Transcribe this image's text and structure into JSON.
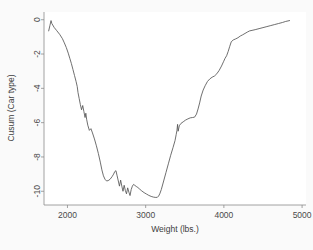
{
  "chart_data": {
    "type": "line",
    "title": "",
    "subtitle": "",
    "xlabel": "Weight (lbs.)",
    "ylabel": "Cusum (Car type)",
    "xlim": [
      1700,
      5050
    ],
    "ylim": [
      -10.8,
      0.45
    ],
    "xticks": [
      2000,
      3000,
      4000,
      5000
    ],
    "xticklabels": [
      "2000",
      "3000",
      "4000",
      "5000"
    ],
    "yticks": [
      0,
      -2,
      -4,
      -6,
      -8,
      -10
    ],
    "yticklabels": [
      "0",
      "-2",
      "-4",
      "-6",
      "-8",
      "-10"
    ],
    "grid": false,
    "legend": null,
    "annotations": [],
    "series": [
      {
        "name": "Cusum (Car type)",
        "color": "#555555",
        "x": [
          1760,
          1775,
          1790,
          1800,
          1830,
          1860,
          1900,
          1935,
          1960,
          1985,
          2010,
          2030,
          2050,
          2070,
          2090,
          2110,
          2125,
          2135,
          2150,
          2165,
          2180,
          2195,
          2210,
          2225,
          2235,
          2245,
          2260,
          2280,
          2300,
          2320,
          2345,
          2370,
          2395,
          2420,
          2440,
          2460,
          2480,
          2500,
          2520,
          2545,
          2570,
          2590,
          2605,
          2620,
          2635,
          2650,
          2665,
          2680,
          2695,
          2710,
          2725,
          2740,
          2755,
          2770,
          2785,
          2800,
          2815,
          2830,
          2845,
          2860,
          2880,
          2900,
          2925,
          2950,
          2980,
          3010,
          3040,
          3070,
          3100,
          3130,
          3150,
          3165,
          3180,
          3200,
          3230,
          3260,
          3290,
          3320,
          3350,
          3375,
          3390,
          3400,
          3408,
          3415,
          3430,
          3450,
          3480,
          3510,
          3540,
          3570,
          3600,
          3625,
          3650,
          3670,
          3690,
          3710,
          3735,
          3760,
          3790,
          3820,
          3850,
          3880,
          3910,
          3940,
          3970,
          3995,
          4015,
          4035,
          4055,
          4075,
          4095,
          4120,
          4150,
          4180,
          4210,
          4240,
          4270,
          4300,
          4330,
          4360,
          4400,
          4450,
          4500,
          4550,
          4600,
          4650,
          4700,
          4750,
          4790,
          4840
        ],
        "y": [
          -0.65,
          -0.35,
          -0.05,
          -0.22,
          -0.45,
          -0.62,
          -0.85,
          -1.1,
          -1.35,
          -1.62,
          -1.95,
          -2.25,
          -2.55,
          -2.9,
          -3.25,
          -3.6,
          -3.9,
          -4.25,
          -4.6,
          -4.95,
          -5.25,
          -5.0,
          -5.35,
          -5.7,
          -5.45,
          -5.8,
          -6.15,
          -6.45,
          -6.35,
          -6.6,
          -6.95,
          -7.35,
          -7.8,
          -8.3,
          -8.75,
          -9.1,
          -9.3,
          -9.4,
          -9.38,
          -9.3,
          -9.15,
          -9.0,
          -8.85,
          -8.8,
          -9.1,
          -9.4,
          -9.7,
          -9.35,
          -9.7,
          -10.0,
          -9.65,
          -9.95,
          -10.15,
          -9.8,
          -10.05,
          -10.25,
          -9.9,
          -9.7,
          -9.6,
          -9.65,
          -9.72,
          -9.78,
          -9.88,
          -9.98,
          -10.08,
          -10.16,
          -10.24,
          -10.3,
          -10.34,
          -10.36,
          -10.35,
          -10.28,
          -10.15,
          -9.9,
          -9.4,
          -8.9,
          -8.4,
          -7.9,
          -7.45,
          -7.05,
          -6.7,
          -6.45,
          -6.1,
          -6.5,
          -6.18,
          -6.05,
          -5.95,
          -5.85,
          -5.78,
          -5.72,
          -5.7,
          -5.68,
          -5.5,
          -5.2,
          -4.85,
          -4.45,
          -4.1,
          -3.85,
          -3.6,
          -3.45,
          -3.35,
          -3.28,
          -3.15,
          -2.95,
          -2.7,
          -2.45,
          -2.25,
          -2.1,
          -1.85,
          -1.55,
          -1.28,
          -1.18,
          -1.12,
          -1.05,
          -0.95,
          -0.88,
          -0.8,
          -0.72,
          -0.65,
          -0.62,
          -0.58,
          -0.52,
          -0.46,
          -0.4,
          -0.34,
          -0.28,
          -0.22,
          -0.16,
          -0.1,
          -0.05
        ]
      }
    ]
  },
  "figure": {
    "background_color": "#fafafa",
    "plot_background_color": "#ffffff",
    "axis_color": "#8c8c8c",
    "line_color": "#555555"
  }
}
